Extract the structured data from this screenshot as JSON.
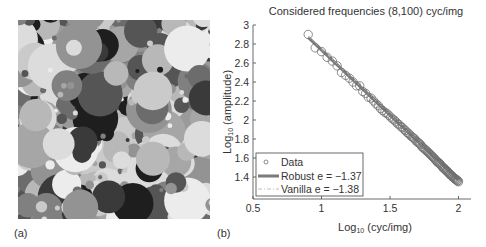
{
  "panels": {
    "a": {
      "label": "(a)",
      "description": "Dead-leaves synthetic image of overlapping gray disks"
    },
    "b": {
      "label": "(b)"
    }
  },
  "chart_data": {
    "type": "scatter",
    "title": "Considered frequencies (8,100) cyc/img",
    "xlabel": "Log10 (cyc/img)",
    "ylabel": "Log10 (amplitude)",
    "xlim": [
      0.5,
      2.1
    ],
    "ylim": [
      1.16,
      3.0
    ],
    "xticks": [
      0.5,
      1,
      1.5,
      2
    ],
    "xtick_labels": [
      "0.5",
      "1",
      "1.5",
      "2"
    ],
    "yticks": [
      1.4,
      1.6,
      1.8,
      2.0,
      2.2,
      2.4,
      2.6,
      2.8,
      3.0
    ],
    "ytick_labels": [
      "1.4",
      "1.6",
      "1.8",
      "2",
      "2.2",
      "2.4",
      "2.6",
      "2.8",
      "3"
    ],
    "grid": false,
    "legend_position": "lower left",
    "legend": [
      {
        "name": "Data",
        "style": "circle-marker"
      },
      {
        "name": "Robust e = −1.37",
        "style": "thick-solid-line"
      },
      {
        "name": "Vanilla e = −1.38",
        "style": "dash-dot-line"
      }
    ],
    "series": [
      {
        "name": "Data",
        "x": [
          0.903,
          0.954,
          1.0,
          1.041,
          1.079,
          1.114,
          1.146,
          1.176,
          1.204,
          1.23,
          1.255,
          1.279,
          1.301,
          1.322,
          1.342,
          1.362,
          1.38,
          1.398,
          1.415,
          1.431,
          1.447,
          1.462,
          1.477,
          1.491,
          1.505,
          1.519,
          1.531,
          1.544,
          1.556,
          1.568,
          1.58,
          1.591,
          1.602,
          1.613,
          1.623,
          1.633,
          1.643,
          1.653,
          1.663,
          1.672,
          1.681,
          1.69,
          1.699,
          1.708,
          1.716,
          1.724,
          1.732,
          1.74,
          1.748,
          1.756,
          1.763,
          1.771,
          1.778,
          1.785,
          1.792,
          1.799,
          1.806,
          1.813,
          1.82,
          1.826,
          1.833,
          1.839,
          1.845,
          1.851,
          1.857,
          1.863,
          1.869,
          1.875,
          1.881,
          1.886,
          1.892,
          1.898,
          1.903,
          1.908,
          1.914,
          1.919,
          1.924,
          1.929,
          1.934,
          1.94,
          1.944,
          1.949,
          1.954,
          1.959,
          1.964,
          1.968,
          1.973,
          1.978,
          1.982,
          1.987,
          1.991,
          1.996,
          2.0
        ],
        "y": [
          2.9,
          2.76,
          2.72,
          2.66,
          2.62,
          2.57,
          2.5,
          2.47,
          2.44,
          2.4,
          2.36,
          2.36,
          2.3,
          2.28,
          2.24,
          2.23,
          2.2,
          2.17,
          2.15,
          2.12,
          2.1,
          2.08,
          2.07,
          2.05,
          2.03,
          2.01,
          2.0,
          1.98,
          1.96,
          1.95,
          1.93,
          1.92,
          1.9,
          1.89,
          1.87,
          1.86,
          1.85,
          1.83,
          1.82,
          1.81,
          1.8,
          1.78,
          1.77,
          1.76,
          1.75,
          1.74,
          1.72,
          1.71,
          1.7,
          1.69,
          1.68,
          1.67,
          1.66,
          1.65,
          1.64,
          1.63,
          1.62,
          1.61,
          1.6,
          1.59,
          1.58,
          1.57,
          1.56,
          1.55,
          1.55,
          1.54,
          1.53,
          1.52,
          1.51,
          1.5,
          1.49,
          1.49,
          1.48,
          1.47,
          1.46,
          1.46,
          1.45,
          1.44,
          1.43,
          1.43,
          1.42,
          1.41,
          1.41,
          1.4,
          1.39,
          1.39,
          1.38,
          1.38,
          1.37,
          1.37,
          1.36,
          1.36,
          1.35
        ]
      },
      {
        "name": "Robust",
        "slope": -1.37,
        "x": [
          0.903,
          2.0
        ],
        "y": [
          2.87,
          1.37
        ]
      },
      {
        "name": "Vanilla",
        "slope": -1.38,
        "x": [
          0.903,
          2.0
        ],
        "y": [
          2.88,
          1.37
        ]
      }
    ]
  },
  "colors": {
    "data_marker": "#6e6e6e",
    "robust_line": "#7a7a7a",
    "vanilla_line": "#bdbdbd",
    "axis": "#444444"
  }
}
